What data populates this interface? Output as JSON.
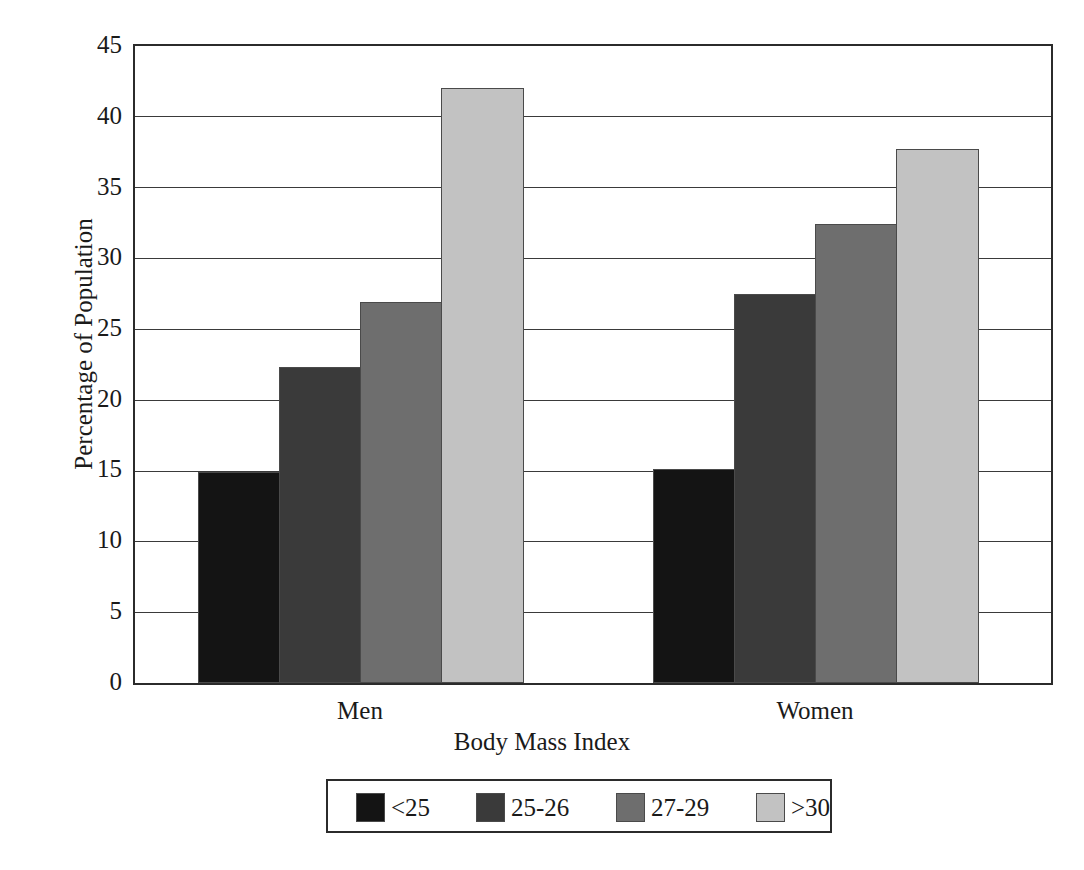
{
  "chart_data": {
    "type": "bar",
    "title": "",
    "subtitle": "",
    "xlabel": "Body Mass Index",
    "ylabel": "Percentage of Population",
    "categories": [
      "Men",
      "Women"
    ],
    "series": [
      {
        "name": "<25",
        "values": [
          14.9,
          15.1
        ],
        "color": "#141414"
      },
      {
        "name": "25-26",
        "values": [
          22.3,
          27.5
        ],
        "color": "#3a3a3a"
      },
      {
        "name": "27-29",
        "values": [
          26.9,
          32.4
        ],
        "color": "#6e6e6e"
      },
      {
        "name": ">30",
        "values": [
          42.0,
          37.7
        ],
        "color": "#c2c2c2"
      }
    ],
    "ylim": [
      0,
      45
    ],
    "yticks": [
      0,
      5,
      10,
      15,
      20,
      25,
      30,
      35,
      40,
      45
    ],
    "ytick_labels": [
      "0",
      "5",
      "10",
      "15",
      "20",
      "25",
      "30",
      "35",
      "40",
      "45"
    ],
    "grid": true,
    "grid_axis": "y",
    "legend_position": "bottom",
    "legend_orientation": "horizontal",
    "bar_group_gap": true
  },
  "axes": {
    "y": {
      "title": "Percentage of Population",
      "ticks": [
        {
          "label": "45",
          "value": 45
        },
        {
          "label": "40",
          "value": 40
        },
        {
          "label": "35",
          "value": 35
        },
        {
          "label": "30",
          "value": 30
        },
        {
          "label": "25",
          "value": 25
        },
        {
          "label": "20",
          "value": 20
        },
        {
          "label": "15",
          "value": 15
        },
        {
          "label": "10",
          "value": 10
        },
        {
          "label": "5",
          "value": 5
        },
        {
          "label": "0",
          "value": 0
        }
      ]
    },
    "x": {
      "title": "Body Mass Index",
      "groups": [
        {
          "label": "Men"
        },
        {
          "label": "Women"
        }
      ]
    }
  },
  "legend": {
    "entries": [
      {
        "label": "<25",
        "color": "#141414"
      },
      {
        "label": "25-26",
        "color": "#3a3a3a"
      },
      {
        "label": "27-29",
        "color": "#6e6e6e"
      },
      {
        "label": ">30",
        "color": "#c2c2c2"
      }
    ]
  }
}
